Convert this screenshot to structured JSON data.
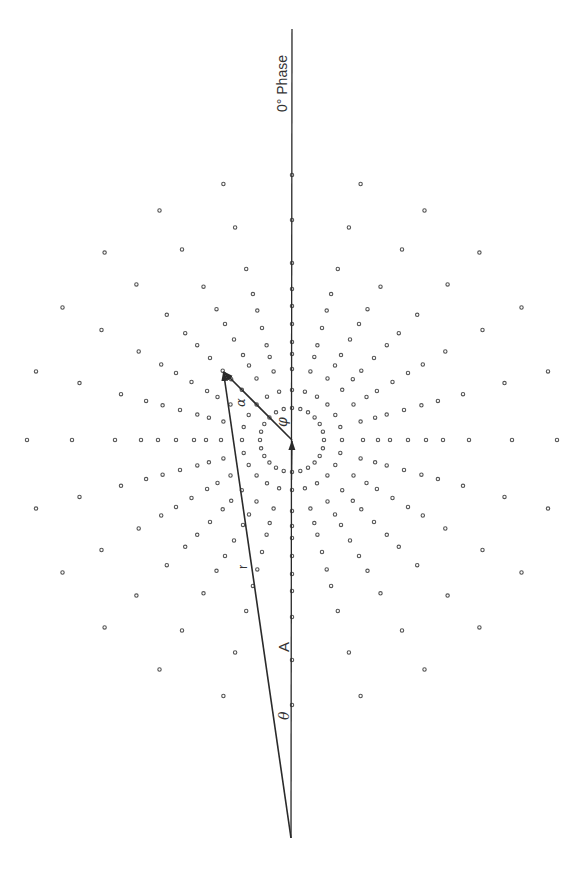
{
  "figure": {
    "axis_label": "0° Phase",
    "labels": {
      "r": "r",
      "A": "A",
      "theta": "θ",
      "alpha": "α",
      "phi": "φ"
    },
    "colors": {
      "line": "#2a2a2a",
      "dot_stroke": "#555555",
      "dot_fill": "#ffffff",
      "text": "#333333",
      "background": "#ffffff"
    }
  },
  "geometry": {
    "center": [
      292,
      440
    ],
    "observer": [
      291,
      838
    ],
    "apex": [
      223,
      371
    ],
    "axis_top": [
      292,
      29
    ],
    "ring_radii": [
      32,
      50,
      71,
      86,
      98,
      116,
      134,
      151,
      177,
      220,
      265
    ],
    "elements_per_ring": 24,
    "angular_step_deg": 15
  }
}
